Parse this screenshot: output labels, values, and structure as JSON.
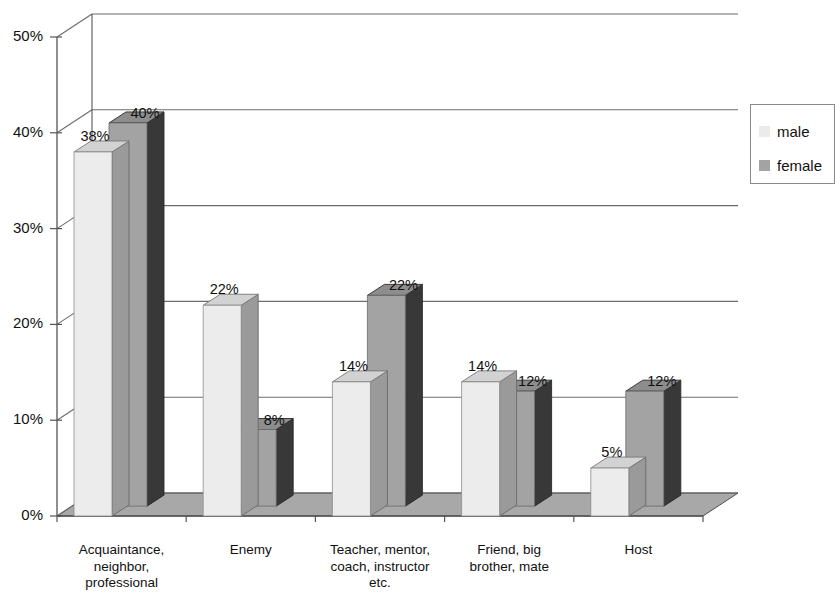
{
  "chart_data": {
    "type": "bar",
    "title": "",
    "subtitle": "",
    "xlabel": "",
    "ylabel": "",
    "ylim": [
      0,
      50
    ],
    "ytick_labels": [
      "0%",
      "10%",
      "20%",
      "30%",
      "40%",
      "50%"
    ],
    "ytick_values": [
      0,
      10,
      20,
      30,
      40,
      50
    ],
    "grid": true,
    "three_d": true,
    "legend_position": "right",
    "value_suffix": "%",
    "categories": [
      "Acquaintance,\nneighbor,\nprofessional",
      "Enemy",
      "Teacher, mentor,\ncoach, instructor\netc.",
      "Friend, big\nbrother, mate",
      "Host"
    ],
    "series": [
      {
        "name": "male",
        "values": [
          38,
          22,
          14,
          14,
          5
        ],
        "labels": [
          "38%",
          "22%",
          "14%",
          "14%",
          "5%"
        ]
      },
      {
        "name": "female",
        "values": [
          40,
          8,
          22,
          12,
          12
        ],
        "labels": [
          "40%",
          "8%",
          "22%",
          "12%",
          "12%"
        ]
      }
    ]
  },
  "legend": {
    "items": [
      {
        "label": "male",
        "color": "#ebebeb"
      },
      {
        "label": "female",
        "color": "#a3a3a3"
      }
    ]
  },
  "colors": {
    "male_front": "#ececec",
    "male_top": "#d2d2d2",
    "male_side": "#9a9a9a",
    "female_front": "#a3a3a3",
    "female_top": "#8d8d8d",
    "female_side": "#383838",
    "floor": "#a8a8a8",
    "axis": "#555555",
    "grid": "#6b6b6b",
    "background": "#ffffff"
  }
}
